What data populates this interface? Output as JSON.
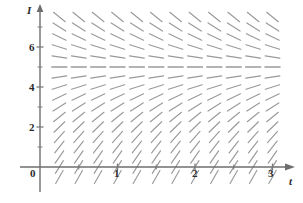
{
  "figure": {
    "kind": "slope-field",
    "background_color": "#ffffff",
    "axis_color": "#6e6e6e",
    "tick_color": "#7a7a7a",
    "segment_color": "#9a9a9a",
    "label_color": "#2b2b2b"
  },
  "axes": {
    "x_axis_label": "t",
    "y_axis_label": "I",
    "x_label_pos": {
      "x": 289,
      "y": 176
    },
    "y_label_pos": {
      "x": 27,
      "y": 5
    },
    "origin_label": "0",
    "origin_label_pos": {
      "x": 30,
      "y": 168
    },
    "x_ticks": [
      {
        "value": 0,
        "label": "",
        "px": 40
      },
      {
        "value": 0.5,
        "label": "",
        "px": 79
      },
      {
        "value": 1,
        "label": "1",
        "px": 118
      },
      {
        "value": 1.5,
        "label": "",
        "px": 157
      },
      {
        "value": 2,
        "label": "2",
        "px": 196
      },
      {
        "value": 2.5,
        "label": "",
        "px": 234
      },
      {
        "value": 3,
        "label": "3",
        "px": 272
      }
    ],
    "x_tick_labels": [
      {
        "text": "1",
        "x": 114,
        "y": 168
      },
      {
        "text": "2",
        "x": 192,
        "y": 168
      },
      {
        "text": "3",
        "x": 268,
        "y": 168
      }
    ],
    "y_ticks": [
      {
        "value": 1,
        "label": "",
        "px": 147
      },
      {
        "value": 2,
        "label": "2",
        "px": 127
      },
      {
        "value": 3,
        "label": "",
        "px": 107
      },
      {
        "value": 4,
        "label": "4",
        "px": 87
      },
      {
        "value": 5,
        "label": "",
        "px": 67
      },
      {
        "value": 6,
        "label": "6",
        "px": 47
      },
      {
        "value": 7,
        "label": "",
        "px": 27
      }
    ],
    "y_tick_labels": [
      {
        "text": "2",
        "x": 29,
        "y": 122
      },
      {
        "text": "4",
        "x": 29,
        "y": 82
      },
      {
        "text": "6",
        "x": 29,
        "y": 42
      }
    ],
    "x_range": [
      -0.05,
      3.25
    ],
    "y_range": [
      -0.75,
      7.6
    ],
    "grid": false,
    "origin_px": {
      "x": 40,
      "y": 167
    },
    "unit_px": {
      "x": 77.5,
      "y": 20
    }
  },
  "chart_data": {
    "type": "scatter",
    "title": "",
    "xlabel": "t",
    "ylabel": "I",
    "xlim": [
      -0.05,
      3.25
    ],
    "ylim": [
      -0.75,
      7.6
    ],
    "grid": false,
    "equation": "dI/dt = k(5 - I)",
    "equilibrium_value": 5,
    "slope_constant": 1.25,
    "segment_half_length_px": 7.5,
    "sample_t": [
      0.0,
      0.25,
      0.5,
      0.75,
      1.0,
      1.25,
      1.5,
      1.75,
      2.0,
      2.25,
      2.5,
      2.75,
      3.0
    ],
    "sample_I": [
      -0.5,
      0.0,
      0.5,
      1.0,
      1.5,
      2.0,
      2.5,
      3.0,
      3.5,
      4.0,
      4.5,
      5.0,
      5.5,
      6.0,
      6.5,
      7.0,
      7.5
    ],
    "slopes_by_I": [
      {
        "I": -0.5,
        "slope": 6.875
      },
      {
        "I": 0.0,
        "slope": 6.25
      },
      {
        "I": 0.5,
        "slope": 5.625
      },
      {
        "I": 1.0,
        "slope": 5.0
      },
      {
        "I": 1.5,
        "slope": 4.375
      },
      {
        "I": 2.0,
        "slope": 3.75
      },
      {
        "I": 2.5,
        "slope": 3.125
      },
      {
        "I": 3.0,
        "slope": 2.5
      },
      {
        "I": 3.5,
        "slope": 1.875
      },
      {
        "I": 4.0,
        "slope": 1.25
      },
      {
        "I": 4.5,
        "slope": 0.625
      },
      {
        "I": 5.0,
        "slope": 0.0
      },
      {
        "I": 5.5,
        "slope": -0.625
      },
      {
        "I": 6.0,
        "slope": -1.25
      },
      {
        "I": 6.5,
        "slope": -1.875
      },
      {
        "I": 7.0,
        "slope": -2.5
      },
      {
        "I": 7.5,
        "slope": -3.125
      }
    ]
  }
}
